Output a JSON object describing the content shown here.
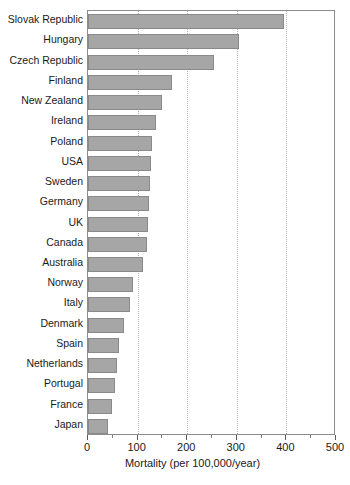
{
  "chart_data": {
    "type": "bar",
    "orientation": "horizontal",
    "title": "",
    "xlabel": "Mortality (per 100,000/year)",
    "ylabel": "",
    "xlim": [
      0,
      500
    ],
    "xticks": [
      0,
      100,
      200,
      300,
      400,
      500
    ],
    "xtick_labels": [
      "0",
      "100",
      "200",
      "300",
      "400",
      "500"
    ],
    "minor_tick_step": 50,
    "grid": "vertical-dotted",
    "legend": "none",
    "bar_color": "#a6a6a6",
    "bar_border_color": "#8a8a8a",
    "frame_color": "#8d8d8d",
    "gridline_color": "#b4b4b4",
    "categories": [
      "Slovak Republic",
      "Hungary",
      "Czech Republic",
      "Finland",
      "New Zealand",
      "Ireland",
      "Poland",
      "USA",
      "Sweden",
      "Germany",
      "UK",
      "Canada",
      "Australia",
      "Norway",
      "Italy",
      "Denmark",
      "Spain",
      "Netherlands",
      "Portugal",
      "France",
      "Japan"
    ],
    "values": [
      395,
      305,
      255,
      170,
      150,
      138,
      130,
      128,
      126,
      122,
      120,
      118,
      110,
      90,
      85,
      72,
      62,
      58,
      55,
      48,
      40
    ]
  }
}
